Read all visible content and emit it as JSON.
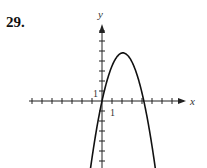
{
  "problem": {
    "number": "29."
  },
  "chart_data": {
    "type": "line",
    "title": "",
    "xlabel": "x",
    "ylabel": "y",
    "tick_labels": {
      "x": "1",
      "y": "1"
    },
    "xlim": [
      -7,
      8
    ],
    "ylim": [
      -6.7,
      7.5
    ],
    "function": "y = -1.1x^2 + 4.6x (approx. downward parabola)",
    "vertex": [
      2.1,
      4.8
    ],
    "roots": [
      0,
      4.2
    ]
  }
}
